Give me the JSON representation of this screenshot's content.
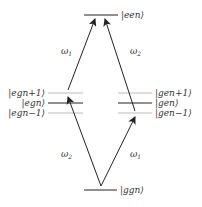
{
  "diagram": {
    "levels": {
      "een": "|een⟩",
      "egn_plus": "|egn+1⟩",
      "egn": "|egn⟩",
      "egn_minus": "|egn−1⟩",
      "gen_plus": "|gen+1⟩",
      "gen": "|gen⟩",
      "gen_minus": "|gen−1⟩",
      "ggn": "|ggn⟩"
    },
    "transitions": {
      "upper_left": {
        "main": "ω",
        "sub": "1"
      },
      "upper_right": {
        "main": "ω",
        "sub": "2"
      },
      "lower_left": {
        "main": "ω",
        "sub": "2"
      },
      "lower_right": {
        "main": "ω",
        "sub": "1"
      }
    },
    "colors": {
      "main_line": "#222222",
      "side_line": "#bbbbbb",
      "arrow": "#222222"
    }
  }
}
